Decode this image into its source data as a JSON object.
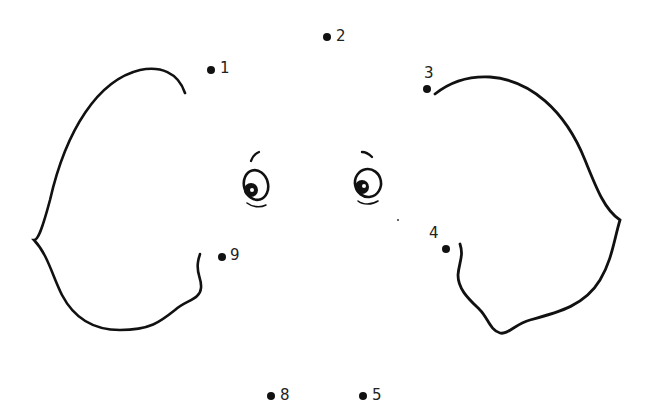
{
  "colors": {
    "ink": "#111111",
    "background": "#ffffff"
  },
  "dots": [
    {
      "label": "1"
    },
    {
      "label": "2"
    },
    {
      "label": "3"
    },
    {
      "label": "4"
    },
    {
      "label": "5"
    },
    {
      "label": "8"
    },
    {
      "label": "9"
    }
  ],
  "figures": {
    "left_ear": "left-ear-outline",
    "right_ear": "right-ear-outline",
    "left_eye": "left-eye",
    "right_eye": "right-eye"
  }
}
